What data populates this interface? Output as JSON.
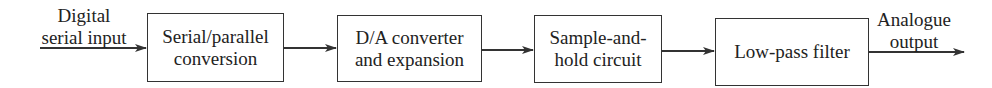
{
  "diagram": {
    "type": "block-diagram",
    "direction": "left-to-right",
    "input_label": "Digital\nserial input",
    "output_label": "Analogue\noutput",
    "blocks": [
      {
        "id": "b1",
        "label": "Serial/parallel\nconversion"
      },
      {
        "id": "b2",
        "label": "D/A converter\nand expansion"
      },
      {
        "id": "b3",
        "label": "Sample-and-\nhold circuit"
      },
      {
        "id": "b4",
        "label": "Low-pass filter"
      }
    ],
    "edges": [
      {
        "from": "input",
        "to": "b1"
      },
      {
        "from": "b1",
        "to": "b2"
      },
      {
        "from": "b2",
        "to": "b3"
      },
      {
        "from": "b3",
        "to": "b4"
      },
      {
        "from": "b4",
        "to": "output"
      }
    ],
    "colors": {
      "stroke": "#333333",
      "text": "#222222",
      "background": "#ffffff"
    }
  }
}
